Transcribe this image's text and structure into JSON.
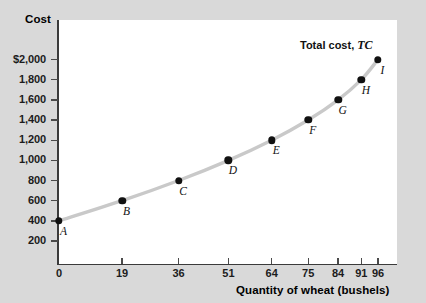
{
  "chart_data": {
    "type": "line",
    "title": "",
    "xlabel": "Quantity of wheat (bushels)",
    "ylabel": "Cost",
    "xlim": [
      0,
      101
    ],
    "ylim": [
      0,
      2120
    ],
    "grid": false,
    "annotation": "Total cost,",
    "annotation_symbol": "TC",
    "series_name": "Total cost, TC",
    "curve_color": "#c9c9c9",
    "point_color": "#111111",
    "background_color": "#d9d9d9",
    "plot_background_color": "#ffffff",
    "x_ticks": [
      "0",
      "19",
      "36",
      "51",
      "64",
      "75",
      "84",
      "91",
      "96"
    ],
    "x_tick_values": [
      0,
      19,
      36,
      51,
      64,
      75,
      84,
      91,
      96
    ],
    "y_ticks": [
      "200",
      "400",
      "600",
      "800",
      "1,000",
      "1,200",
      "1,400",
      "1,600",
      "1,800",
      "$2,000"
    ],
    "y_tick_values": [
      200,
      400,
      600,
      800,
      1000,
      1200,
      1400,
      1600,
      1800,
      2000
    ],
    "points": [
      {
        "label": "A",
        "x": 0,
        "y": 400
      },
      {
        "label": "B",
        "x": 19,
        "y": 600
      },
      {
        "label": "C",
        "x": 36,
        "y": 800
      },
      {
        "label": "D",
        "x": 51,
        "y": 1000
      },
      {
        "label": "E",
        "x": 64,
        "y": 1200
      },
      {
        "label": "F",
        "x": 75,
        "y": 1400
      },
      {
        "label": "G",
        "x": 84,
        "y": 1600
      },
      {
        "label": "H",
        "x": 91,
        "y": 1800
      },
      {
        "label": "I",
        "x": 96,
        "y": 2000
      }
    ]
  }
}
